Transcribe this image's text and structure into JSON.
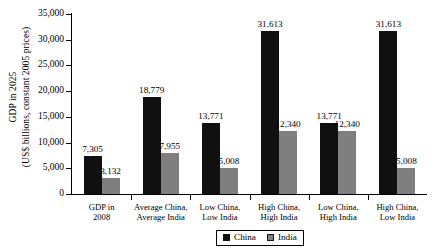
{
  "chart_data": {
    "type": "bar",
    "title": "",
    "xlabel": "",
    "ylabel_line1": "GDP in 2025",
    "ylabel_line2": "(US$ billions, constant 2005 prices)",
    "ylim": [
      0,
      35000
    ],
    "ytick_values": [
      0,
      5000,
      10000,
      15000,
      20000,
      25000,
      30000,
      35000
    ],
    "ytick_labels": [
      "0",
      "5,000",
      "10,000",
      "15,000",
      "20,000",
      "25,000",
      "30,000",
      "35,000"
    ],
    "grid": false,
    "legend_position": "bottom",
    "categories": [
      {
        "line1": "GDP in",
        "line2": "2008"
      },
      {
        "line1": "Average China,",
        "line2": "Average India"
      },
      {
        "line1": "Low China,",
        "line2": "Low India"
      },
      {
        "line1": "High China,",
        "line2": "High India"
      },
      {
        "line1": "Low China,",
        "line2": "High India"
      },
      {
        "line1": "High China,",
        "line2": "Low India"
      }
    ],
    "series": [
      {
        "name": "China",
        "color": "#101010",
        "values": [
          7305,
          18779,
          13771,
          31613,
          13771,
          31613
        ],
        "labels": [
          "7,305",
          "18,779",
          "13,771",
          "31,613",
          "13,771",
          "31,613"
        ]
      },
      {
        "name": "India",
        "color": "#7f7f7f",
        "values": [
          3132,
          7955,
          5008,
          12340,
          12340,
          5008
        ],
        "labels": [
          "3,132",
          "7,955",
          "5,008",
          "12,340",
          "12,340",
          "5,008"
        ]
      }
    ]
  },
  "legend": {
    "items": [
      {
        "label": "China",
        "swatch": "china"
      },
      {
        "label": "India",
        "swatch": "india"
      }
    ]
  }
}
